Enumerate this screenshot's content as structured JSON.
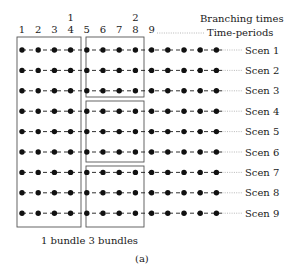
{
  "header": {
    "branching_label": "Branching times",
    "time_periods_label": "Time-periods"
  },
  "period_labels": [
    "1",
    "2",
    "3",
    "4",
    "5",
    "6",
    "7",
    "8",
    "9"
  ],
  "branching_markers": [
    {
      "label": "1",
      "above_period": "4"
    },
    {
      "label": "2",
      "above_period": "8"
    }
  ],
  "scenarios": [
    "Scen 1",
    "Scen 2",
    "Scen 3",
    "Scen 4",
    "Scen 5",
    "Scen 6",
    "Scen 7",
    "Scen 8",
    "Scen 9"
  ],
  "dots_per_scenario": 13,
  "bundles": {
    "stage1": {
      "count": 1,
      "scenarios": [
        "Scen 1",
        "Scen 2",
        "Scen 3",
        "Scen 4",
        "Scen 5",
        "Scen 6",
        "Scen 7",
        "Scen 8",
        "Scen 9"
      ]
    },
    "stage2": {
      "count": 3,
      "groups": [
        [
          "Scen 1",
          "Scen 2",
          "Scen 3"
        ],
        [
          "Scen 4",
          "Scen 5",
          "Scen 6"
        ],
        [
          "Scen 7",
          "Scen 8",
          "Scen 9"
        ]
      ]
    }
  },
  "caption_bundles": "1 bundle 3 bundles",
  "figure_label": "(a)",
  "colors": {
    "ink": "#1a1a1a",
    "box": "#555555",
    "dotted": "#888888"
  }
}
